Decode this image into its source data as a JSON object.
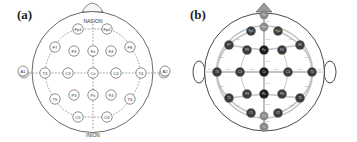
{
  "panels": [
    {
      "label": "(a)",
      "landmarks": {
        "top": "NASION",
        "bottom": "INION"
      },
      "electrodes": [
        {
          "id": "Fp1",
          "x": 78,
          "y": 29
        },
        {
          "id": "Fp2",
          "x": 107,
          "y": 29
        },
        {
          "id": "F7",
          "x": 55,
          "y": 47
        },
        {
          "id": "F3",
          "x": 74,
          "y": 51
        },
        {
          "id": "Fz",
          "x": 93,
          "y": 51
        },
        {
          "id": "F4",
          "x": 111,
          "y": 51
        },
        {
          "id": "F8",
          "x": 130,
          "y": 47
        },
        {
          "id": "A1",
          "x": 23,
          "y": 71
        },
        {
          "id": "T3",
          "x": 45,
          "y": 73
        },
        {
          "id": "C3",
          "x": 68,
          "y": 73
        },
        {
          "id": "Cz",
          "x": 93,
          "y": 73
        },
        {
          "id": "C4",
          "x": 116,
          "y": 73
        },
        {
          "id": "T4",
          "x": 141,
          "y": 73
        },
        {
          "id": "A2",
          "x": 165,
          "y": 71
        },
        {
          "id": "T5",
          "x": 55,
          "y": 99
        },
        {
          "id": "P3",
          "x": 74,
          "y": 95
        },
        {
          "id": "Pz",
          "x": 93,
          "y": 95
        },
        {
          "id": "P4",
          "x": 111,
          "y": 95
        },
        {
          "id": "T6",
          "x": 130,
          "y": 99
        },
        {
          "id": "O1",
          "x": 78,
          "y": 117
        },
        {
          "id": "O2",
          "x": 107,
          "y": 117
        }
      ]
    },
    {
      "label": "(b)",
      "distance_labels": [
        "10%",
        "20%"
      ],
      "colors": {
        "midline": "#1e1e1e",
        "lateral": "#3c3c3c",
        "landmark": "#8a8a8a",
        "arc": "#bdbdbd"
      },
      "electrodes": [
        {
          "id": "Nz",
          "x": 264,
          "y": 15,
          "type": "landmark"
        },
        {
          "id": "Fpz",
          "x": 264,
          "y": 27,
          "type": "landmark"
        },
        {
          "id": "Fp1",
          "x": 251,
          "y": 31,
          "type": "lateral"
        },
        {
          "id": "Fp2",
          "x": 278,
          "y": 31,
          "type": "lateral"
        },
        {
          "id": "F7",
          "x": 229,
          "y": 45,
          "type": "lateral"
        },
        {
          "id": "F3",
          "x": 247,
          "y": 50,
          "type": "lateral"
        },
        {
          "id": "Fz",
          "x": 264,
          "y": 50,
          "type": "midline"
        },
        {
          "id": "F4",
          "x": 282,
          "y": 50,
          "type": "lateral"
        },
        {
          "id": "F8",
          "x": 300,
          "y": 45,
          "type": "lateral"
        },
        {
          "id": "T3",
          "x": 217,
          "y": 72,
          "type": "lateral"
        },
        {
          "id": "C3",
          "x": 240,
          "y": 72,
          "type": "lateral"
        },
        {
          "id": "Cz",
          "x": 264,
          "y": 72,
          "type": "midline"
        },
        {
          "id": "C4",
          "x": 288,
          "y": 72,
          "type": "lateral"
        },
        {
          "id": "T4",
          "x": 312,
          "y": 72,
          "type": "lateral"
        },
        {
          "id": "T5",
          "x": 229,
          "y": 98,
          "type": "lateral"
        },
        {
          "id": "P3",
          "x": 247,
          "y": 94,
          "type": "lateral"
        },
        {
          "id": "Pz",
          "x": 264,
          "y": 94,
          "type": "midline"
        },
        {
          "id": "P4",
          "x": 282,
          "y": 94,
          "type": "lateral"
        },
        {
          "id": "T6",
          "x": 300,
          "y": 98,
          "type": "lateral"
        },
        {
          "id": "O1",
          "x": 251,
          "y": 113,
          "type": "lateral"
        },
        {
          "id": "Oz",
          "x": 264,
          "y": 116,
          "type": "landmark"
        },
        {
          "id": "O2",
          "x": 278,
          "y": 113,
          "type": "lateral"
        },
        {
          "id": "Iz",
          "x": 264,
          "y": 127,
          "type": "landmark"
        }
      ]
    }
  ]
}
